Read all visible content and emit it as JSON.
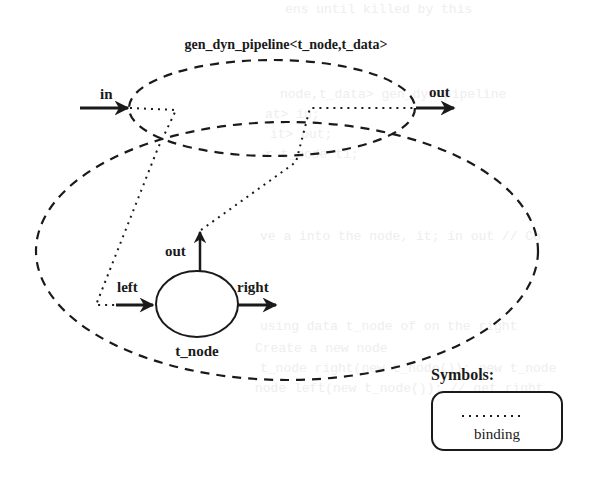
{
  "title": "gen_dyn_pipeline<t_node,t_data>",
  "outer_ports": {
    "in": "in",
    "out": "out"
  },
  "node": {
    "name": "t_node",
    "ports": {
      "left": "left",
      "right": "right",
      "out": "out"
    }
  },
  "legend": {
    "heading": "Symbols:",
    "items": [
      {
        "line_style": "dotted",
        "label": "binding"
      }
    ]
  },
  "background_text": [
    "ens until killed by this",
    "node,t_data> gen_dyn_pipeline",
    "at> in;",
    "it> out;",
    "r t_node t1;",
    "ve a into the node, it; in out // Co",
    "using data t_node of on the right",
    "Create a new node",
    "t_node right(new t_node()); new t_node",
    "node left(new t_node()); // get right"
  ],
  "colors": {
    "ink": "#1a1a1a",
    "background": "#ffffff",
    "bleed": "#ececec"
  }
}
